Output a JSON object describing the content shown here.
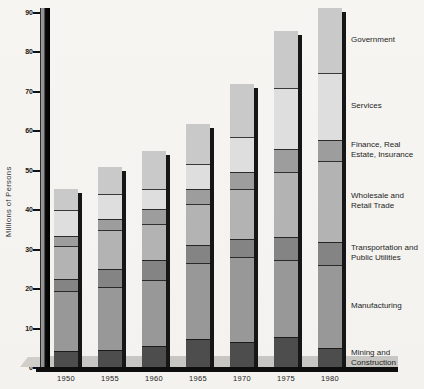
{
  "y_axis": {
    "title": "Millions of Persons",
    "ticks": [
      0,
      10,
      20,
      30,
      40,
      50,
      60,
      70,
      80,
      90
    ]
  },
  "chart_data": {
    "type": "bar",
    "stacked": true,
    "title": "",
    "xlabel": "",
    "ylabel": "Millions of Persons",
    "ylim": [
      0,
      90
    ],
    "gridlines": false,
    "legend_position": "right",
    "categories": [
      "1950",
      "1955",
      "1960",
      "1965",
      "1970",
      "1975",
      "1980"
    ],
    "series": [
      {
        "name": "Mining and Construction",
        "color": "#4d4d4d",
        "values": [
          4.2,
          4.6,
          5.5,
          7.4,
          6.6,
          7.9,
          5.1
        ]
      },
      {
        "name": "Manufacturing",
        "color": "#989898",
        "values": [
          15.3,
          16.0,
          16.7,
          19.1,
          21.5,
          19.4,
          21.1
        ]
      },
      {
        "name": "Transportation and Public Utilities",
        "color": "#848484",
        "values": [
          3.0,
          4.6,
          5.1,
          4.6,
          4.7,
          5.9,
          5.7
        ]
      },
      {
        "name": "Wholesale and Retail Trade",
        "color": "#b3b3b3",
        "values": [
          8.5,
          9.9,
          9.3,
          10.5,
          12.6,
          16.4,
          20.7
        ]
      },
      {
        "name": "Finance, Real Estate, Insurance",
        "color": "#9d9d9d",
        "values": [
          2.5,
          2.7,
          3.8,
          3.8,
          4.2,
          5.9,
          5.2
        ]
      },
      {
        "name": "Services",
        "color": "#dedede",
        "values": [
          6.5,
          6.4,
          5.0,
          6.3,
          8.9,
          15.6,
          17.1
        ]
      },
      {
        "name": "Government",
        "color": "#c9c9c9",
        "values": [
          5.5,
          6.8,
          9.7,
          10.2,
          13.4,
          14.3,
          16.3
        ]
      }
    ],
    "totals": [
      45.5,
      51.0,
      55.1,
      61.9,
      71.9,
      85.4,
      91.2
    ]
  },
  "legend": {
    "items": [
      {
        "label": "Government"
      },
      {
        "label": "Services"
      },
      {
        "label": "Finance, Real\nEstate, Insurance"
      },
      {
        "label": "Wholesale and\nRetail Trade"
      },
      {
        "label": "Transportation and\nPublic Utilities"
      },
      {
        "label": "Manufacturing"
      },
      {
        "label": "Mining and\nConstruction"
      }
    ]
  },
  "colors": {
    "background": "#f5f4f0",
    "axis": "#0e0e0e",
    "platform": "#c7c6c2",
    "bar_shadow": "#161616"
  }
}
